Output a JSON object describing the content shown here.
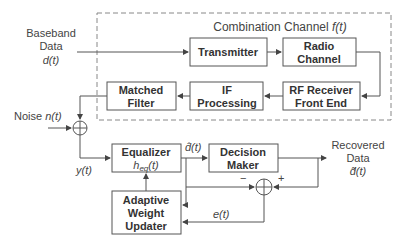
{
  "title": "Combination Channel f(t)",
  "title_text": "Combination Channel ",
  "title_var": "f(t)",
  "blocks": {
    "transmitter": [
      "Transmitter"
    ],
    "radio_channel": [
      "Radio",
      "Channel"
    ],
    "rf_receiver": [
      "RF Receiver",
      "Front End"
    ],
    "if_processing": [
      "IF",
      "Processing"
    ],
    "matched_filter": [
      "Matched",
      "Filter"
    ],
    "equalizer": [
      "Equalizer"
    ],
    "equalizer_sub": "h",
    "equalizer_subscript": "eq",
    "equalizer_arg": "(t)",
    "decision_maker": [
      "Decision",
      "Maker"
    ],
    "adaptive": [
      "Adaptive",
      "Weight",
      "Updater"
    ]
  },
  "labels": {
    "baseband": [
      "Baseband",
      "Data",
      "d(t)"
    ],
    "noise_text": "Noise ",
    "noise_var": "n(t)",
    "y": "y(t)",
    "dhat": "d̂(t)",
    "recovered": [
      "Recovered",
      "Data",
      "d̃(t)"
    ],
    "e": "e(t)",
    "minus": "−",
    "plus": "+"
  }
}
